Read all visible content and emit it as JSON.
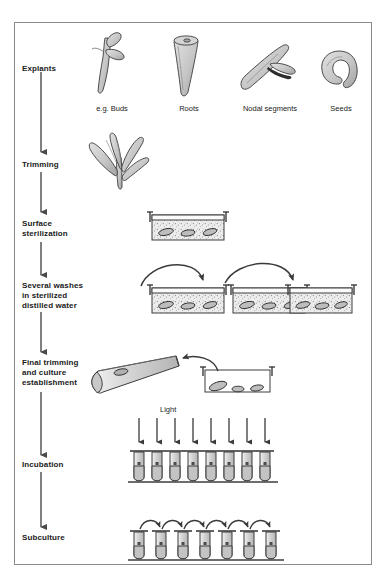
{
  "figure": {
    "border_color": "#8a8a8a",
    "background": "#ffffff",
    "ink_color": "#2b2b2b",
    "fill_light": "#d8d8d8",
    "fill_mid": "#bdbdbd",
    "fill_dark": "#8f8f8f"
  },
  "stages": [
    {
      "id": "explants",
      "label": "Explants",
      "x": 22,
      "y": 64
    },
    {
      "id": "trimming",
      "label": "Trimming",
      "x": 22,
      "y": 160
    },
    {
      "id": "surface-sterilization",
      "label": "Surface\nsterilization",
      "x": 22,
      "y": 219
    },
    {
      "id": "several-washes",
      "label": "Several washes\nin sterilized\ndistilled water",
      "x": 22,
      "y": 281
    },
    {
      "id": "final-trimming",
      "label": "Final trimming\nand culture\nestablishment",
      "x": 22,
      "y": 358
    },
    {
      "id": "incubation",
      "label": "Incubation",
      "x": 22,
      "y": 460
    },
    {
      "id": "subculture",
      "label": "Subculture",
      "x": 22,
      "y": 533
    }
  ],
  "explants": {
    "items": [
      {
        "id": "buds",
        "label": "e.g. Buds",
        "cx": 112,
        "label_y": 104
      },
      {
        "id": "roots",
        "label": "Roots",
        "cx": 189,
        "label_y": 104
      },
      {
        "id": "nodal-segments",
        "label": "Nodal segments",
        "cx": 270,
        "label_y": 104
      },
      {
        "id": "seeds",
        "label": "Seeds",
        "cx": 340,
        "label_y": 104
      }
    ]
  },
  "incubation": {
    "light_label": "Light",
    "light_label_x": 160,
    "light_label_y": 405,
    "tube_count": 8,
    "arrow_count": 8
  },
  "subculture": {
    "tube_count": 7,
    "transfer_arrow_count": 6
  },
  "washes": {
    "tray_count": 3,
    "transfer_arrow_count": 2,
    "explants_per_tray": 3
  },
  "sterilization": {
    "tray_count": 1,
    "explants_in_tray": 3
  },
  "final_trimming": {
    "tray_count": 1,
    "explants_in_tray": 3,
    "tube_count": 1,
    "transfer_arrow_count": 1
  },
  "flow_arrows": {
    "count": 6,
    "column_x": 41
  }
}
